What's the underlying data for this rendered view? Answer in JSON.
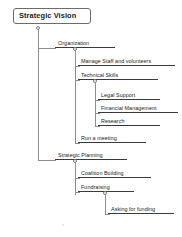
{
  "diagram": {
    "type": "hierarchy-tree",
    "root": {
      "label": "Strategic Vision",
      "level": 0
    },
    "nodes": [
      {
        "label": "Organization",
        "level": 1
      },
      {
        "label": "Manage Staff and volunteers",
        "level": 2
      },
      {
        "label": "Technical Skills",
        "level": 2
      },
      {
        "label": "Legal Support",
        "level": 3
      },
      {
        "label": "Financial Management",
        "level": 3
      },
      {
        "label": "Research",
        "level": 3
      },
      {
        "label": "Run a meeting",
        "level": 2
      },
      {
        "label": "Strategic Planning",
        "level": 1
      },
      {
        "label": "Coalition Building",
        "level": 2
      },
      {
        "label": "Fundraising",
        "level": 2
      },
      {
        "label": "Asking for funding",
        "level": 3
      }
    ],
    "colors": {
      "background": "#ffffff",
      "node_underline": "#3a3a3a",
      "connector": "#8d8d8d",
      "root_border": "#6b6b6b",
      "text": "#232323",
      "handle_fill": "#ffffff"
    }
  }
}
